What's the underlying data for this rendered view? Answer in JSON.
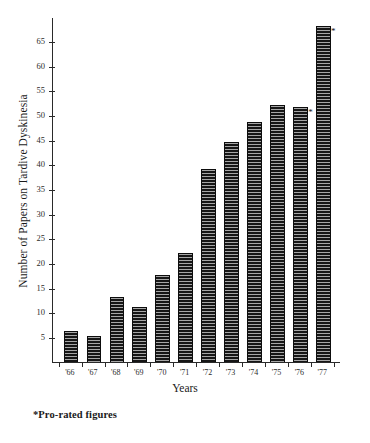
{
  "chart_data": {
    "type": "bar",
    "title": "",
    "xlabel": "Years",
    "ylabel": "Number of Papers on Tardive Dyskinesia",
    "categories": [
      "'66",
      "'67",
      "'68",
      "'69",
      "'70",
      "'71",
      "'72",
      "'73",
      "'74",
      "'75",
      "'76",
      "'77"
    ],
    "values": [
      6,
      5,
      13,
      11,
      17.5,
      22,
      39,
      44.5,
      48.5,
      52,
      51.5,
      68
    ],
    "ylim": [
      0,
      70
    ],
    "ytick_labels": [
      "5",
      "10",
      "15",
      "20",
      "25",
      "30",
      "35",
      "40",
      "45",
      "50",
      "55",
      "60",
      "65"
    ],
    "ytick_values": [
      5,
      10,
      15,
      20,
      25,
      30,
      35,
      40,
      45,
      50,
      55,
      60,
      65
    ],
    "grid": false,
    "legend": "none",
    "annotations": [
      {
        "category": "'76",
        "marker": "*",
        "note": "Pro-rated figures"
      },
      {
        "category": "'77",
        "marker": "*",
        "note": "Pro-rated figures"
      }
    ],
    "bar_fill": "#161616",
    "bar_pattern": "horizontal-hatch",
    "axis_color": "#2a2a2a"
  },
  "footnote": {
    "text": "*Pro-rated figures"
  }
}
